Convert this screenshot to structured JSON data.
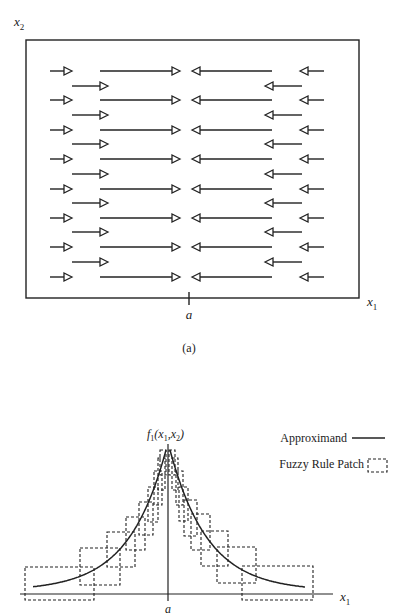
{
  "panel_a": {
    "y_axis_label": "x",
    "y_axis_sub": "2",
    "x_axis_label": "x",
    "x_axis_sub": "1",
    "tick_label": "a",
    "caption": "(a)",
    "box": {
      "x1": 26,
      "y1": 40,
      "x2": 359,
      "y2": 298
    },
    "major_rows_y": [
      71,
      100,
      130,
      159,
      189,
      218,
      247,
      277
    ],
    "minor_rows_y": [
      86,
      115,
      144,
      174,
      203,
      232,
      262
    ],
    "major_arrows": [
      {
        "dir": "right",
        "x_start": 50,
        "x_end": 72
      },
      {
        "dir": "right",
        "x_start": 100,
        "x_end": 180
      },
      {
        "dir": "left",
        "x_start": 272,
        "x_end": 192
      },
      {
        "dir": "left",
        "x_start": 324,
        "x_end": 300
      }
    ],
    "minor_arrows": [
      {
        "dir": "right",
        "x_start": 72,
        "x_end": 108
      },
      {
        "dir": "left",
        "x_start": 302,
        "x_end": 265
      }
    ],
    "tick_x": 189
  },
  "panel_b": {
    "function_label": "f",
    "function_sub": "1",
    "function_args": "(x",
    "function_args_sub1": "1",
    "function_args_mid": ",x",
    "function_args_sub2": "2",
    "function_args_end": ")",
    "x_axis_label": "x",
    "x_axis_sub": "1",
    "tick_label": "a",
    "legend": {
      "approximand": "Approximand",
      "patch": "Fuzzy Rule Patch"
    },
    "axis_y": 594,
    "center_x": 168,
    "patches_left": [
      {
        "x1": 25,
        "y1": 567,
        "x2": 94,
        "y2": 600
      },
      {
        "x1": 80,
        "y1": 548,
        "x2": 120,
        "y2": 585
      },
      {
        "x1": 107,
        "y1": 532,
        "x2": 135,
        "y2": 567
      },
      {
        "x1": 126,
        "y1": 517,
        "x2": 145,
        "y2": 550
      },
      {
        "x1": 139,
        "y1": 502,
        "x2": 153,
        "y2": 535
      },
      {
        "x1": 148,
        "y1": 487,
        "x2": 158,
        "y2": 522
      },
      {
        "x1": 154,
        "y1": 471,
        "x2": 162,
        "y2": 505
      },
      {
        "x1": 158,
        "y1": 458,
        "x2": 165,
        "y2": 490
      },
      {
        "x1": 160,
        "y1": 450,
        "x2": 166,
        "y2": 475
      }
    ],
    "patches_right": [
      {
        "x1": 242,
        "y1": 566,
        "x2": 313,
        "y2": 600
      },
      {
        "x1": 217,
        "y1": 547,
        "x2": 256,
        "y2": 583
      },
      {
        "x1": 201,
        "y1": 531,
        "x2": 228,
        "y2": 566
      },
      {
        "x1": 191,
        "y1": 514,
        "x2": 210,
        "y2": 550
      },
      {
        "x1": 184,
        "y1": 500,
        "x2": 197,
        "y2": 536
      },
      {
        "x1": 179,
        "y1": 487,
        "x2": 188,
        "y2": 521
      },
      {
        "x1": 176,
        "y1": 471,
        "x2": 183,
        "y2": 505
      },
      {
        "x1": 172,
        "y1": 458,
        "x2": 178,
        "y2": 490
      },
      {
        "x1": 169,
        "y1": 450,
        "x2": 175,
        "y2": 475
      }
    ]
  },
  "colors": {
    "ink": "#222222",
    "background": "#ffffff"
  }
}
